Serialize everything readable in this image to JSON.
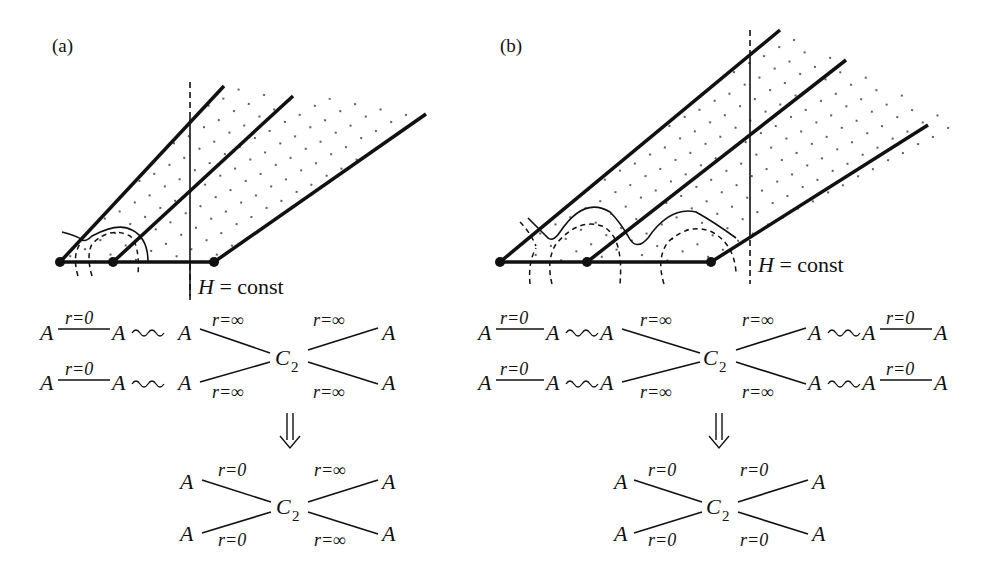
{
  "figure": {
    "panels": [
      {
        "id": "a",
        "label": "(a)",
        "slice_label": {
          "H": "H",
          "eq": " = const"
        },
        "top_diagram": {
          "rows": [
            {
              "left_A": "A",
              "edge_label": "r=0",
              "mid_A": "A",
              "wavy": "~",
              "inner_A": "A",
              "to_center_label": "r=∞",
              "right_label": "r=∞",
              "right_A": "A"
            },
            {
              "left_A": "A",
              "edge_label": "r=0",
              "mid_A": "A",
              "wavy": "~",
              "inner_A": "A",
              "to_center_label": "r=∞",
              "right_label": "r=∞",
              "right_A": "A"
            }
          ],
          "center": {
            "C": "C",
            "sub": "2"
          }
        },
        "arrow": "⇓",
        "result_diagram": {
          "top_left": {
            "A": "A",
            "label": "r=0"
          },
          "bottom_left": {
            "A": "A",
            "label": "r=0"
          },
          "top_right": {
            "A": "A",
            "label": "r=∞"
          },
          "bottom_right": {
            "A": "A",
            "label": "r=∞"
          },
          "center": {
            "C": "C",
            "sub": "2"
          }
        }
      },
      {
        "id": "b",
        "label": "(b)",
        "slice_label": {
          "H": "H",
          "eq": " = const"
        },
        "top_diagram": {
          "rows": [
            {
              "left_A": "A",
              "edge_label": "r=0",
              "mid_A": "A",
              "inner_A": "A",
              "to_center_label": "r=∞",
              "right_label": "r=∞",
              "right_inner_A": "A",
              "right_mid_A": "A",
              "right_edge_label": "r=0",
              "right_A": "A"
            },
            {
              "left_A": "A",
              "edge_label": "r=0",
              "mid_A": "A",
              "inner_A": "A",
              "to_center_label": "r=∞",
              "right_label": "r=∞",
              "right_inner_A": "A",
              "right_mid_A": "A",
              "right_edge_label": "r=0",
              "right_A": "A"
            }
          ],
          "center": {
            "C": "C",
            "sub": "2"
          }
        },
        "arrow": "⇓",
        "result_diagram": {
          "top_left": {
            "A": "A",
            "label": "r=0"
          },
          "bottom_left": {
            "A": "A",
            "label": "r=0"
          },
          "top_right": {
            "A": "A",
            "label": "r=0"
          },
          "bottom_right": {
            "A": "A",
            "label": "r=0"
          },
          "center": {
            "C": "C",
            "sub": "2"
          }
        }
      }
    ]
  }
}
